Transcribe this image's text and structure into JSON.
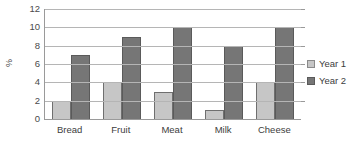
{
  "chart_data": {
    "type": "bar",
    "title": "",
    "subtitle": "",
    "xlabel": "",
    "ylabel": "%",
    "categories": [
      "Bread",
      "Fruit",
      "Meat",
      "Milk",
      "Cheese"
    ],
    "series": [
      {
        "name": "Year 1",
        "color": "#c6c6c6",
        "values": [
          2,
          4,
          3,
          1,
          4
        ]
      },
      {
        "name": "Year 2",
        "color": "#767676",
        "values": [
          7,
          9,
          10,
          8,
          10
        ]
      }
    ],
    "ylim": [
      0,
      12
    ],
    "yticks": [
      0,
      2,
      4,
      6,
      8,
      10,
      12
    ],
    "ytick_labels": [
      "0",
      "2",
      "4",
      "6",
      "8",
      "10",
      "12"
    ],
    "grid": true,
    "grid_axis": "y",
    "legend_position": "right",
    "orientation": "vertical",
    "grouping": "grouped"
  }
}
